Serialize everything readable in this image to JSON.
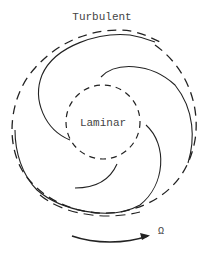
{
  "diagram": {
    "outer_label": "Turbulent",
    "inner_label": "Laminar",
    "rotation_symbol": "Ω",
    "colors": {
      "stroke": "#222222",
      "text": "#444444",
      "background": "#ffffff"
    },
    "elements": {
      "outer_region": "turbulent-dashed-boundary",
      "inner_region": "laminar-dashed-boundary",
      "spiral_arms": 3,
      "rotation_arrow": "clockwise-arrow"
    }
  }
}
